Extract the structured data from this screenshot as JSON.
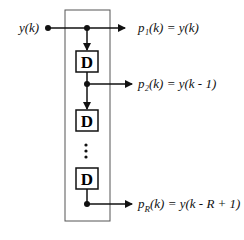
{
  "diagram": {
    "input": {
      "label": "y(k)"
    },
    "delay_symbol": "D",
    "ellipsis": "⋮",
    "outputs": [
      {
        "name": "p1",
        "label": "p₁(k) = y(k)"
      },
      {
        "name": "p2",
        "label": "p₂(k) = y(k - 1)"
      },
      {
        "name": "pR",
        "label": "p_R(k) = y(k - R + 1)",
        "display": "pR(k) = y(k - R + 1)"
      }
    ],
    "colors": {
      "line": "#111111",
      "box": "#333333",
      "background": "#ffffff"
    }
  }
}
